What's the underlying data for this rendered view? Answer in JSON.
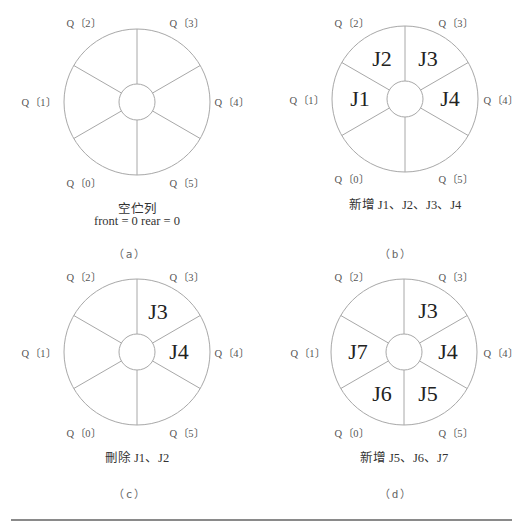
{
  "figure": {
    "panels": [
      {
        "id": "a",
        "sublabel": "（a）",
        "caption_lines": [
          "空伫列",
          "front = 0  rear = 0"
        ],
        "slots": [
          "Q〔0〕",
          "Q〔1〕",
          "Q〔2〕",
          "Q〔3〕",
          "Q〔4〕",
          "Q〔5〕"
        ],
        "contents": [
          "",
          "",
          "",
          "",
          "",
          ""
        ]
      },
      {
        "id": "b",
        "sublabel": "（b）",
        "caption_lines": [
          "新增 J1、J2、J3、J4"
        ],
        "slots": [
          "Q〔0〕",
          "Q〔1〕",
          "Q〔2〕",
          "Q〔3〕",
          "Q〔4〕",
          "Q〔5〕"
        ],
        "contents": [
          "",
          "J1",
          "J2",
          "J3",
          "J4",
          ""
        ]
      },
      {
        "id": "c",
        "sublabel": "（c）",
        "caption_lines": [
          "刪除 J1、J2"
        ],
        "slots": [
          "Q〔0〕",
          "Q〔1〕",
          "Q〔2〕",
          "Q〔3〕",
          "Q〔4〕",
          "Q〔5〕"
        ],
        "contents": [
          "",
          "",
          "",
          "J3",
          "J4",
          ""
        ]
      },
      {
        "id": "d",
        "sublabel": "（d）",
        "caption_lines": [
          "新增 J5、J6、J7"
        ],
        "slots": [
          "Q〔0〕",
          "Q〔1〕",
          "Q〔2〕",
          "Q〔3〕",
          "Q〔4〕",
          "Q〔5〕"
        ],
        "contents": [
          "J6",
          "J7",
          "",
          "J3",
          "J4",
          "J5"
        ]
      }
    ],
    "colors": {
      "stroke": "#a8a8a8",
      "text": "#333333",
      "rule": "#8a8a8a"
    }
  }
}
